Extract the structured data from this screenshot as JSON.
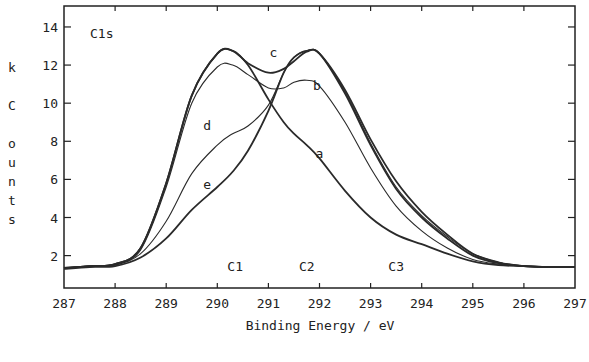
{
  "chart_data": {
    "type": "line",
    "title": "",
    "panel_label": "C1s",
    "xlabel": "Binding Energy / eV",
    "ylabel": "k Counts",
    "xlim": [
      287,
      297
    ],
    "ylim": [
      0.3,
      15.1
    ],
    "xticks": [
      287,
      288,
      289,
      290,
      291,
      292,
      293,
      294,
      295,
      296,
      297
    ],
    "yticks": [
      2,
      4,
      6,
      8,
      10,
      12,
      14
    ],
    "grid": false,
    "legend": null,
    "annotations": [
      {
        "text": "C1",
        "x": 290.35,
        "y": 1.2
      },
      {
        "text": "C2",
        "x": 291.75,
        "y": 1.2
      },
      {
        "text": "C3",
        "x": 293.5,
        "y": 1.2
      },
      {
        "text": "a",
        "x": 292.0,
        "y": 7.1
      },
      {
        "text": "b",
        "x": 291.95,
        "y": 10.7
      },
      {
        "text": "c",
        "x": 291.1,
        "y": 12.4
      },
      {
        "text": "d",
        "x": 289.8,
        "y": 8.6
      },
      {
        "text": "e",
        "x": 289.8,
        "y": 5.5
      }
    ],
    "x": [
      287,
      287.5,
      288,
      288.5,
      289,
      289.5,
      290,
      290.3,
      290.6,
      291,
      291.3,
      291.5,
      291.75,
      292,
      292.5,
      293,
      293.5,
      294,
      294.5,
      295,
      295.5,
      296,
      296.5,
      297
    ],
    "series": [
      {
        "name": "a",
        "values": [
          1.35,
          1.45,
          1.55,
          2.4,
          5.8,
          10.4,
          12.6,
          12.75,
          12.0,
          10.2,
          9.0,
          8.4,
          7.8,
          7.1,
          5.4,
          4.0,
          3.1,
          2.6,
          2.1,
          1.7,
          1.5,
          1.45,
          1.4,
          1.4
        ]
      },
      {
        "name": "b",
        "values": [
          1.35,
          1.45,
          1.55,
          2.3,
          5.6,
          10.0,
          11.9,
          12.0,
          11.5,
          10.8,
          10.8,
          11.1,
          11.2,
          10.9,
          9.0,
          6.6,
          4.6,
          3.3,
          2.4,
          1.8,
          1.55,
          1.45,
          1.4,
          1.4
        ]
      },
      {
        "name": "c",
        "values": [
          1.35,
          1.45,
          1.55,
          2.4,
          5.8,
          10.4,
          12.6,
          12.75,
          12.1,
          11.6,
          11.8,
          12.2,
          12.7,
          12.6,
          10.5,
          7.8,
          5.5,
          4.0,
          2.9,
          2.0,
          1.6,
          1.45,
          1.4,
          1.4
        ]
      },
      {
        "name": "d",
        "values": [
          1.35,
          1.45,
          1.5,
          2.1,
          3.8,
          6.3,
          7.8,
          8.4,
          8.8,
          9.9,
          11.6,
          12.4,
          12.75,
          12.6,
          10.6,
          7.9,
          5.6,
          4.1,
          3.0,
          2.1,
          1.65,
          1.45,
          1.4,
          1.4
        ]
      },
      {
        "name": "e",
        "values": [
          1.3,
          1.4,
          1.45,
          1.9,
          2.9,
          4.4,
          5.6,
          6.4,
          7.5,
          9.6,
          11.6,
          12.4,
          12.75,
          12.6,
          10.7,
          8.1,
          5.9,
          4.3,
          3.1,
          2.1,
          1.65,
          1.45,
          1.4,
          1.4
        ]
      }
    ]
  },
  "labels": {
    "panel": "C1s",
    "xlabel": "Binding Energy / eV",
    "ylabel_chars": [
      "k",
      "",
      "C",
      "o",
      "u",
      "n",
      "t",
      "s"
    ]
  }
}
